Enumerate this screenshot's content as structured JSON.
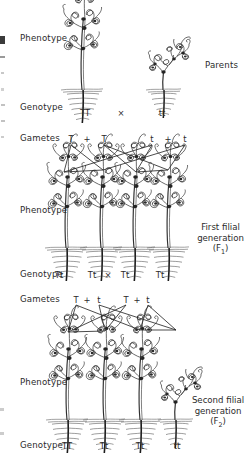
{
  "figure": {
    "ink_color": "#2b2b2b"
  },
  "rows": {
    "phenotype_label": "Phenotype",
    "genotype_label": "Genotype",
    "gametes_label": "Gametes",
    "cross_symbol": "×",
    "plus_symbol": "+"
  },
  "sections": [
    {
      "name": "parents",
      "side_label": "Parents",
      "phenotype_label": "Phenotype",
      "genotype_label": "Genotype",
      "gametes_label": "Gametes",
      "plants": [
        {
          "genotype": "TT",
          "height": "tall"
        },
        {
          "genotype": "tt",
          "height": "dwarf"
        }
      ],
      "genotypes": [
        "TT",
        "tt"
      ],
      "cross_symbol": "×",
      "gametes": [
        {
          "left": "T",
          "plus": "+",
          "right": "T"
        },
        {
          "left": "t",
          "plus": "+",
          "right": "t"
        }
      ]
    },
    {
      "name": "f1",
      "side_label_line1": "First filial",
      "side_label_line2": "generation",
      "side_label_line3": "(F",
      "side_label_sub": "1",
      "side_label_line3_end": ")",
      "phenotype_label": "Phenotype",
      "genotype_label": "Genotype",
      "gametes_label": "Gametes",
      "plants": [
        {
          "genotype": "Tt",
          "height": "tall"
        },
        {
          "genotype": "Tt",
          "height": "tall"
        },
        {
          "genotype": "Tt",
          "height": "tall"
        },
        {
          "genotype": "Tt",
          "height": "tall"
        }
      ],
      "genotypes": [
        "Tt",
        "Tt",
        "Tt",
        "Tt"
      ],
      "cross_symbol": "×",
      "gametes": [
        {
          "left": "T",
          "plus": "+",
          "right": "t"
        },
        {
          "left": "T",
          "plus": "+",
          "right": "t"
        }
      ]
    },
    {
      "name": "f2",
      "side_label_line1": "Second filial",
      "side_label_line2": "generation",
      "side_label_line3": "(F",
      "side_label_sub": "2",
      "side_label_line3_end": ")",
      "phenotype_label": "Phenotype",
      "genotype_label": "Genotype",
      "plants": [
        {
          "genotype": "TT",
          "height": "tall"
        },
        {
          "genotype": "Tt",
          "height": "tall"
        },
        {
          "genotype": "Tt",
          "height": "tall"
        },
        {
          "genotype": "tt",
          "height": "dwarf"
        }
      ],
      "genotypes": [
        "TT",
        "Tt",
        "Tt",
        "tt"
      ]
    }
  ],
  "labels": {
    "p_phenotype": "Phenotype",
    "p_parents": "Parents",
    "p_genotype": "Genotype",
    "p_geno_1": "TT",
    "p_cross": "×",
    "p_geno_2": "tt",
    "p_gametes": "Gametes",
    "p_gam_1": "T",
    "p_gam_plus_1": "+",
    "p_gam_2": "T",
    "p_gam_3": "t",
    "p_gam_plus_2": "+",
    "p_gam_4": "t",
    "f1_phenotype": "Phenotype",
    "f1_side_1": "First filial",
    "f1_side_2": "generation",
    "f1_genotype": "Genotype",
    "f1_geno_1": "Tt",
    "f1_geno_2": "Tt",
    "f1_cross": "×",
    "f1_geno_3": "Tt",
    "f1_geno_4": "Tt",
    "f1_gametes": "Gametes",
    "f1_gam_1": "T",
    "f1_gam_plus_1": "+",
    "f1_gam_2": "t",
    "f1_gam_3": "T",
    "f1_gam_plus_2": "+",
    "f1_gam_4": "t",
    "f2_phenotype": "Phenotype",
    "f2_side_1": "Second filial",
    "f2_side_2": "generation",
    "f2_genotype": "Genotype",
    "f2_geno_1": "TT",
    "f2_geno_2": "Tt",
    "f2_geno_3": "Tt",
    "f2_geno_4": "tt"
  }
}
